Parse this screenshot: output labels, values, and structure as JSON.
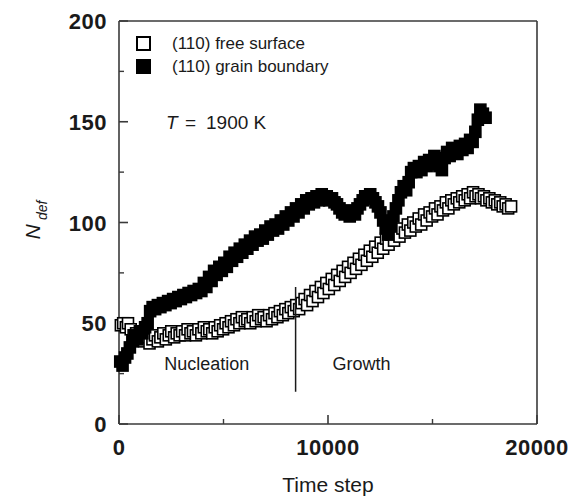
{
  "chart_data": {
    "type": "scatter",
    "title": "",
    "xlabel": "Time step",
    "ylabel": "N_def",
    "ylabel_main": "N",
    "ylabel_sub": "def",
    "xlim": [
      0,
      20000
    ],
    "ylim": [
      0,
      200
    ],
    "xticks": [
      0,
      10000,
      20000
    ],
    "xtick_labels": [
      "0",
      "10000",
      "20000"
    ],
    "xminor_ticks": [
      5000,
      15000
    ],
    "yticks": [
      0,
      50,
      100,
      150,
      200
    ],
    "ytick_labels": [
      "0",
      "50",
      "100",
      "150",
      "200"
    ],
    "yminor_ticks": [
      25,
      75,
      125,
      175
    ],
    "grid": false,
    "legend_position": "top-left",
    "annotations": [
      {
        "text": "T = 1900 K",
        "x": 2200,
        "y": 150,
        "italic_prefix": "T",
        "rest": " =  1900 K"
      },
      {
        "text": "Nucleation",
        "x": 4200,
        "y": 27
      },
      {
        "text": "Growth",
        "x": 11600,
        "y": 27
      }
    ],
    "divider_line": {
      "x": 8450,
      "y_from": 16,
      "y_to": 68
    },
    "series": [
      {
        "name": "(110) free surface",
        "marker": "open-square",
        "color": "#000000",
        "fill": "#ffffff",
        "points": [
          [
            90,
            49
          ],
          [
            200,
            50
          ],
          [
            330,
            48
          ],
          [
            430,
            50
          ],
          [
            560,
            47
          ],
          [
            700,
            44
          ],
          [
            820,
            45
          ],
          [
            960,
            42
          ],
          [
            1080,
            44
          ],
          [
            1200,
            41
          ],
          [
            1340,
            43
          ],
          [
            1460,
            40
          ],
          [
            1600,
            42
          ],
          [
            1720,
            44
          ],
          [
            1860,
            41
          ],
          [
            1980,
            43
          ],
          [
            2120,
            45
          ],
          [
            2240,
            42
          ],
          [
            2380,
            44
          ],
          [
            2500,
            46
          ],
          [
            2640,
            43
          ],
          [
            2760,
            45
          ],
          [
            2900,
            44
          ],
          [
            3020,
            46
          ],
          [
            3160,
            44
          ],
          [
            3280,
            47
          ],
          [
            3420,
            45
          ],
          [
            3540,
            46
          ],
          [
            3680,
            44
          ],
          [
            3800,
            47
          ],
          [
            3940,
            45
          ],
          [
            4060,
            48
          ],
          [
            4200,
            46
          ],
          [
            4320,
            47
          ],
          [
            4460,
            45
          ],
          [
            4580,
            48
          ],
          [
            4720,
            46
          ],
          [
            4840,
            49
          ],
          [
            4980,
            47
          ],
          [
            5100,
            50
          ],
          [
            5240,
            48
          ],
          [
            5360,
            51
          ],
          [
            5500,
            49
          ],
          [
            5620,
            52
          ],
          [
            5760,
            50
          ],
          [
            5880,
            53
          ],
          [
            6020,
            51
          ],
          [
            6140,
            52
          ],
          [
            6280,
            50
          ],
          [
            6400,
            53
          ],
          [
            6540,
            51
          ],
          [
            6660,
            54
          ],
          [
            6800,
            52
          ],
          [
            6920,
            53
          ],
          [
            7060,
            51
          ],
          [
            7180,
            54
          ],
          [
            7320,
            52
          ],
          [
            7440,
            55
          ],
          [
            7580,
            53
          ],
          [
            7700,
            56
          ],
          [
            7840,
            54
          ],
          [
            7960,
            57
          ],
          [
            8100,
            55
          ],
          [
            8220,
            58
          ],
          [
            8360,
            56
          ],
          [
            8480,
            59
          ],
          [
            8620,
            57
          ],
          [
            8740,
            60
          ],
          [
            8880,
            62
          ],
          [
            9000,
            59
          ],
          [
            9140,
            64
          ],
          [
            9260,
            61
          ],
          [
            9400,
            66
          ],
          [
            9520,
            63
          ],
          [
            9660,
            68
          ],
          [
            9780,
            65
          ],
          [
            9920,
            70
          ],
          [
            10040,
            67
          ],
          [
            10180,
            72
          ],
          [
            10300,
            69
          ],
          [
            10440,
            74
          ],
          [
            10560,
            71
          ],
          [
            10700,
            76
          ],
          [
            10820,
            73
          ],
          [
            10960,
            78
          ],
          [
            11080,
            75
          ],
          [
            11220,
            80
          ],
          [
            11340,
            77
          ],
          [
            11480,
            82
          ],
          [
            11600,
            79
          ],
          [
            11740,
            84
          ],
          [
            11860,
            81
          ],
          [
            12000,
            86
          ],
          [
            12120,
            83
          ],
          [
            12260,
            88
          ],
          [
            12380,
            85
          ],
          [
            12520,
            90
          ],
          [
            12640,
            87
          ],
          [
            12780,
            92
          ],
          [
            12900,
            89
          ],
          [
            13040,
            94
          ],
          [
            13160,
            91
          ],
          [
            13300,
            96
          ],
          [
            13420,
            93
          ],
          [
            13560,
            97
          ],
          [
            13680,
            95
          ],
          [
            13820,
            99
          ],
          [
            13940,
            96
          ],
          [
            14080,
            100
          ],
          [
            14200,
            98
          ],
          [
            14340,
            102
          ],
          [
            14460,
            99
          ],
          [
            14600,
            104
          ],
          [
            14720,
            101
          ],
          [
            14860,
            105
          ],
          [
            14980,
            103
          ],
          [
            15120,
            107
          ],
          [
            15240,
            104
          ],
          [
            15380,
            108
          ],
          [
            15500,
            106
          ],
          [
            15640,
            110
          ],
          [
            15760,
            107
          ],
          [
            15900,
            111
          ],
          [
            16020,
            109
          ],
          [
            16160,
            112
          ],
          [
            16280,
            110
          ],
          [
            16420,
            113
          ],
          [
            16540,
            111
          ],
          [
            16680,
            114
          ],
          [
            16800,
            112
          ],
          [
            16940,
            115
          ],
          [
            17060,
            113
          ],
          [
            17200,
            114
          ],
          [
            17320,
            112
          ],
          [
            17460,
            113
          ],
          [
            17580,
            111
          ],
          [
            17720,
            112
          ],
          [
            17840,
            110
          ],
          [
            17980,
            111
          ],
          [
            18100,
            109
          ],
          [
            18240,
            110
          ],
          [
            18360,
            108
          ],
          [
            18500,
            109
          ],
          [
            18620,
            107
          ],
          [
            18760,
            108
          ]
        ]
      },
      {
        "name": "(110) grain boundary",
        "marker": "filled-square",
        "color": "#000000",
        "fill": "#000000",
        "points": [
          [
            60,
            31
          ],
          [
            170,
            29
          ],
          [
            290,
            33
          ],
          [
            400,
            35
          ],
          [
            520,
            38
          ],
          [
            640,
            41
          ],
          [
            760,
            44
          ],
          [
            880,
            42
          ],
          [
            1000,
            46
          ],
          [
            1120,
            45
          ],
          [
            1250,
            48
          ],
          [
            1370,
            50
          ],
          [
            1490,
            56
          ],
          [
            1610,
            58
          ],
          [
            1730,
            57
          ],
          [
            1860,
            59
          ],
          [
            1980,
            58
          ],
          [
            2100,
            60
          ],
          [
            2220,
            59
          ],
          [
            2350,
            61
          ],
          [
            2470,
            60
          ],
          [
            2590,
            62
          ],
          [
            2710,
            61
          ],
          [
            2840,
            63
          ],
          [
            2960,
            62
          ],
          [
            3080,
            64
          ],
          [
            3200,
            63
          ],
          [
            3330,
            65
          ],
          [
            3450,
            64
          ],
          [
            3570,
            66
          ],
          [
            3690,
            65
          ],
          [
            3820,
            67
          ],
          [
            3940,
            66
          ],
          [
            4060,
            70
          ],
          [
            4180,
            68
          ],
          [
            4310,
            73
          ],
          [
            4430,
            71
          ],
          [
            4550,
            76
          ],
          [
            4670,
            74
          ],
          [
            4800,
            78
          ],
          [
            4920,
            76
          ],
          [
            5040,
            80
          ],
          [
            5160,
            78
          ],
          [
            5290,
            83
          ],
          [
            5410,
            81
          ],
          [
            5530,
            85
          ],
          [
            5650,
            83
          ],
          [
            5780,
            87
          ],
          [
            5900,
            85
          ],
          [
            6020,
            89
          ],
          [
            6140,
            87
          ],
          [
            6270,
            91
          ],
          [
            6390,
            89
          ],
          [
            6510,
            93
          ],
          [
            6630,
            91
          ],
          [
            6760,
            94
          ],
          [
            6880,
            92
          ],
          [
            7000,
            96
          ],
          [
            7120,
            94
          ],
          [
            7250,
            98
          ],
          [
            7370,
            96
          ],
          [
            7490,
            99
          ],
          [
            7610,
            97
          ],
          [
            7740,
            101
          ],
          [
            7860,
            99
          ],
          [
            7980,
            103
          ],
          [
            8100,
            101
          ],
          [
            8230,
            105
          ],
          [
            8350,
            103
          ],
          [
            8470,
            107
          ],
          [
            8590,
            105
          ],
          [
            8720,
            109
          ],
          [
            8840,
            107
          ],
          [
            8960,
            111
          ],
          [
            9080,
            109
          ],
          [
            9210,
            112
          ],
          [
            9330,
            110
          ],
          [
            9450,
            113
          ],
          [
            9570,
            111
          ],
          [
            9700,
            114
          ],
          [
            9820,
            112
          ],
          [
            9940,
            113
          ],
          [
            10060,
            111
          ],
          [
            10190,
            112
          ],
          [
            10310,
            110
          ],
          [
            10430,
            109
          ],
          [
            10550,
            107
          ],
          [
            10680,
            105
          ],
          [
            10800,
            104
          ],
          [
            10920,
            106
          ],
          [
            11040,
            103
          ],
          [
            11170,
            105
          ],
          [
            11290,
            104
          ],
          [
            11410,
            107
          ],
          [
            11530,
            109
          ],
          [
            11660,
            111
          ],
          [
            11780,
            113
          ],
          [
            11900,
            112
          ],
          [
            12020,
            114
          ],
          [
            12150,
            112
          ],
          [
            12270,
            110
          ],
          [
            12390,
            108
          ],
          [
            12510,
            105
          ],
          [
            12640,
            101
          ],
          [
            12760,
            97
          ],
          [
            12880,
            94
          ],
          [
            13000,
            98
          ],
          [
            13130,
            103
          ],
          [
            13250,
            107
          ],
          [
            13370,
            111
          ],
          [
            13490,
            115
          ],
          [
            13620,
            118
          ],
          [
            13740,
            116
          ],
          [
            13860,
            120
          ],
          [
            13980,
            125
          ],
          [
            14110,
            127
          ],
          [
            14230,
            125
          ],
          [
            14350,
            128
          ],
          [
            14470,
            126
          ],
          [
            14600,
            130
          ],
          [
            14720,
            128
          ],
          [
            14840,
            131
          ],
          [
            14960,
            129
          ],
          [
            15090,
            133
          ],
          [
            15210,
            131
          ],
          [
            15330,
            128
          ],
          [
            15450,
            126
          ],
          [
            15580,
            132
          ],
          [
            15700,
            135
          ],
          [
            15820,
            133
          ],
          [
            15940,
            137
          ],
          [
            16070,
            136
          ],
          [
            16190,
            134
          ],
          [
            16310,
            138
          ],
          [
            16430,
            136
          ],
          [
            16560,
            139
          ],
          [
            16680,
            137
          ],
          [
            16800,
            141
          ],
          [
            16920,
            140
          ],
          [
            17050,
            145
          ],
          [
            17170,
            151
          ],
          [
            17290,
            156
          ],
          [
            17410,
            154
          ],
          [
            17540,
            152
          ]
        ]
      }
    ]
  },
  "legend": {
    "items": [
      {
        "label": "(110) free surface",
        "marker": "open-square"
      },
      {
        "label": "(110) grain boundary",
        "marker": "filled-square"
      }
    ]
  },
  "axis": {
    "x_title": "Time step",
    "y_title_main": "N",
    "y_title_sub": "def"
  },
  "regions": {
    "left_label": "Nucleation",
    "right_label": "Growth"
  },
  "temperature": {
    "symbol": "T",
    "equals": "=",
    "value": "1900 K",
    "full": "T = 1900 K"
  },
  "colors": {
    "axis": "#3a3a3a",
    "text": "#1a1a1a",
    "marker": "#000000",
    "background": "#ffffff"
  }
}
